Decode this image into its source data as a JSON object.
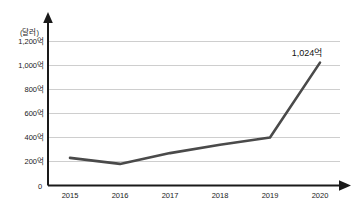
{
  "chart_data": {
    "type": "line",
    "title": "",
    "subtitle": "",
    "xlabel": "",
    "ylabel": "",
    "unit_label": "(달러)",
    "origin_label": "0",
    "categories": [
      "2015",
      "2016",
      "2017",
      "2018",
      "2019",
      "2020"
    ],
    "values": [
      230,
      180,
      270,
      340,
      400,
      1024
    ],
    "ytick_labels": [
      "200억",
      "400억",
      "600억",
      "800억",
      "1,000억",
      "1,200억"
    ],
    "ytick_values": [
      200,
      400,
      600,
      800,
      1000,
      1200
    ],
    "ylim": [
      0,
      1300
    ],
    "grid": true,
    "legend": false,
    "legend_position": "none",
    "annotations": [
      {
        "label": "1,024억",
        "category": "2020",
        "value": 1024
      }
    ],
    "series": [
      {
        "name": "",
        "values": [
          230,
          180,
          270,
          340,
          400,
          1024
        ],
        "color": "#4a4a4a"
      }
    ],
    "colors": {
      "line": "#4a4a4a",
      "gridline": "#b9b9b9",
      "axis": "#1a1a1a",
      "background": "#ffffff",
      "text": "#1a1a1a"
    }
  }
}
